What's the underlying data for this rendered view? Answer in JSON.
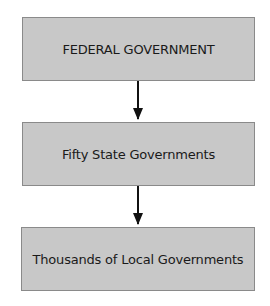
{
  "diagram": {
    "type": "flowchart",
    "direction": "top-to-bottom",
    "nodes": [
      {
        "id": "federal",
        "label": "FEDERAL GOVERNMENT"
      },
      {
        "id": "state",
        "label": "Fifty State Governments"
      },
      {
        "id": "local",
        "label": "Thousands of Local Governments"
      }
    ],
    "edges": [
      {
        "from": "federal",
        "to": "state"
      },
      {
        "from": "state",
        "to": "local"
      }
    ],
    "colors": {
      "box_fill": "#c8c8c8",
      "box_border": "#8a8a8a",
      "arrow": "#111111",
      "text": "#1a1a1a"
    }
  }
}
